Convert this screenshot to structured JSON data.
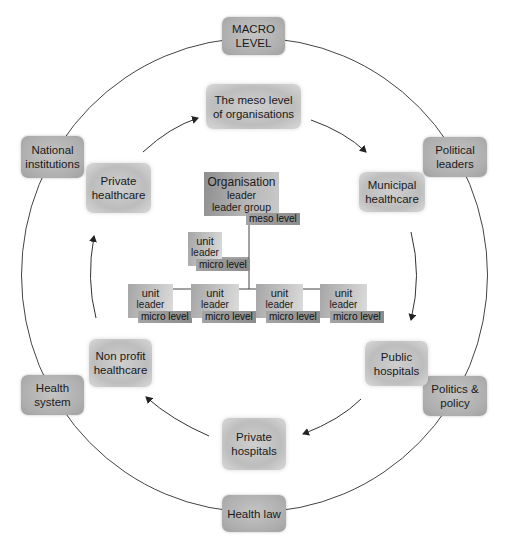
{
  "macro_ring": {
    "top": "MACRO\nLEVEL",
    "top_lines": [
      "MACRO",
      "LEVEL"
    ],
    "items": [
      {
        "id": "macro-level",
        "lines": [
          "MACRO",
          "LEVEL"
        ]
      },
      {
        "id": "political-leaders",
        "lines": [
          "Political",
          "leaders"
        ]
      },
      {
        "id": "politics-policy",
        "lines": [
          "Politics &",
          "policy"
        ]
      },
      {
        "id": "health-law",
        "lines": [
          "Health law"
        ]
      },
      {
        "id": "health-system",
        "lines": [
          "Health",
          "system"
        ]
      },
      {
        "id": "national-institutions",
        "lines": [
          "National",
          "institutions"
        ]
      }
    ]
  },
  "meso_cycle": {
    "items": [
      {
        "id": "meso-level-organisations",
        "lines": [
          "The meso level",
          "of organisations"
        ]
      },
      {
        "id": "municipal-healthcare",
        "lines": [
          "Municipal",
          "healthcare"
        ]
      },
      {
        "id": "public-hospitals",
        "lines": [
          "Public",
          "hospitals"
        ]
      },
      {
        "id": "private-hospitals",
        "lines": [
          "Private",
          "hospitals"
        ]
      },
      {
        "id": "non-profit-healthcare",
        "lines": [
          "Non profit",
          "healthcare"
        ]
      },
      {
        "id": "private-healthcare",
        "lines": [
          "Private",
          "healthcare"
        ]
      }
    ],
    "arrow_direction": "clockwise"
  },
  "org_chart": {
    "top": {
      "lines": [
        "Organisation",
        "leader",
        "leader group"
      ],
      "tag": "meso level"
    },
    "mid_unit": {
      "lines": [
        "unit",
        "leader"
      ],
      "tag": "micro level"
    },
    "units": [
      {
        "lines": [
          "unit",
          "leader"
        ],
        "tag": "micro level"
      },
      {
        "lines": [
          "unit",
          "leader"
        ],
        "tag": "micro level"
      },
      {
        "lines": [
          "unit",
          "leader"
        ],
        "tag": "micro level"
      },
      {
        "lines": [
          "unit",
          "leader"
        ],
        "tag": "micro level"
      }
    ]
  },
  "colors": {
    "line": "#3a3a3a",
    "box_outer": "#aeaeae",
    "box_inner": "#c8c8c8",
    "tag": "#959595"
  }
}
